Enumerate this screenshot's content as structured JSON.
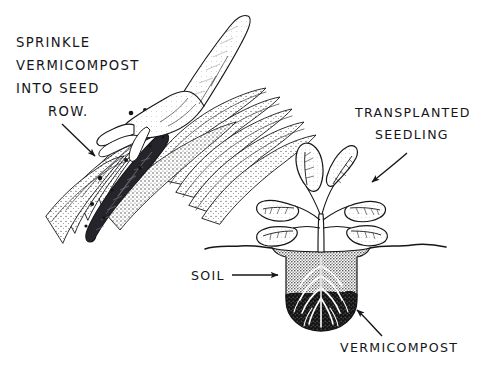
{
  "figure": {
    "background_color": "#ffffff",
    "ink_color": "#16161a"
  },
  "annotations": {
    "instruction": {
      "name": "sprinkle-instruction",
      "lines": [
        "SPRINKLE",
        "VERMICOMPOST",
        "INTO SEED",
        "ROW."
      ]
    },
    "seedling_label": {
      "name": "transplanted-seedling-label",
      "lines": [
        "TRANSPLANTED",
        "SEEDLING"
      ]
    },
    "soil_label": {
      "name": "soil-label",
      "text": "SOIL"
    },
    "vermicompost_label": {
      "name": "vermicompost-label",
      "text": "VERMICOMPOST"
    }
  },
  "scene_left": {
    "name": "seed-row-scene",
    "caption": "Hand sprinkling dark vermicompost granules into an open furrow between ridged soil rows",
    "elements": [
      "hand-sprinkling",
      "furrow-seed-row",
      "soil-ridges",
      "compost-granules"
    ]
  },
  "scene_right": {
    "name": "transplant-cross-section",
    "caption": "Cross-section of planting hole: grey soil above, black vermicompost bowl below, white roots of seedling",
    "elements": [
      "seedling-plant",
      "ground-line",
      "soil-layer",
      "vermicompost-layer",
      "root-system"
    ],
    "leaf_count": 6
  },
  "colors": {
    "ink": "#16161a",
    "soil_fill": "#9a9a9a",
    "compost_fill": "#1b1b1b",
    "paper": "#ffffff"
  }
}
